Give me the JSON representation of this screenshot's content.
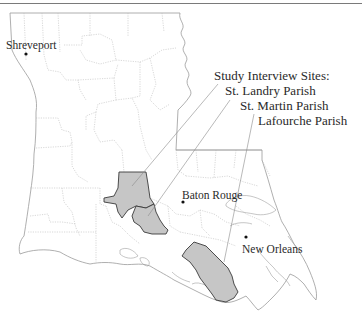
{
  "map": {
    "title_rule": true,
    "colors": {
      "border": "#9a9a9a",
      "parish_line": "#b8b8b8",
      "highlight_fill": "#c6c6c6",
      "highlight_stroke": "#3a3a3a",
      "leader_line": "#8a8a8a",
      "city_dot": "#111111"
    },
    "cities": [
      {
        "name": "Shreveport",
        "x": 26,
        "y": 54
      },
      {
        "name": "Baton Rouge",
        "x": 183,
        "y": 202
      },
      {
        "name": "New Orleans",
        "x": 246,
        "y": 237
      }
    ],
    "legend": {
      "title": "Study Interview Sites:",
      "items": [
        {
          "label": "St. Landry Parish"
        },
        {
          "label": "St. Martin Parish"
        },
        {
          "label": "Lafourche Parish"
        }
      ]
    }
  }
}
